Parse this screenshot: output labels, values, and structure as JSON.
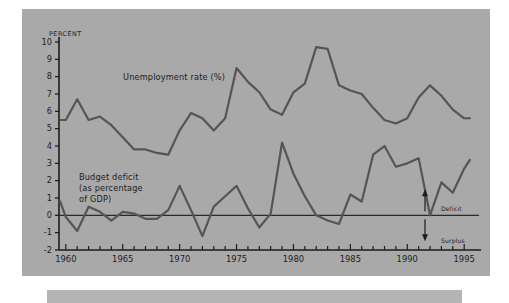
{
  "figure": {
    "axis_unit_label": "PERCENT",
    "background_color": "#a9a9a9",
    "line_color": "#555555",
    "axis_color": "#1d1d1d"
  },
  "annotations": {
    "unemployment_label": "Unemployment rate (%)",
    "budget_label_line1": "Budget deficit",
    "budget_label_line2": "(as percentage",
    "budget_label_line3": "of GDP)",
    "deficit_arrow_label": "Deficit",
    "surplus_arrow_label": "Surplus"
  },
  "chart_data": {
    "type": "line",
    "title": "",
    "xlabel": "",
    "ylabel": "PERCENT",
    "xlim": [
      1959.4,
      1995.6
    ],
    "ylim": [
      -2,
      10
    ],
    "yticks": [
      10,
      9,
      8,
      7,
      6,
      5,
      4,
      3,
      2,
      1,
      0,
      -1,
      -2
    ],
    "ytick_labels": [
      "10",
      "9",
      "8",
      "7",
      "6",
      "5",
      "4",
      "3",
      "2",
      "1",
      "0",
      "-1",
      "-2"
    ],
    "xticks_major": [
      1960,
      1965,
      1970,
      1975,
      1980,
      1985,
      1990,
      1995
    ],
    "xtick_labels": [
      "1960",
      "1965",
      "1970",
      "1975",
      "1980",
      "1985",
      "1990",
      "1995"
    ],
    "xticks_minor_step": 1,
    "grid": false,
    "legend": "inline-annotations",
    "zero_line": true,
    "x": [
      1959.5,
      1960,
      1961,
      1962,
      1963,
      1964,
      1965,
      1966,
      1967,
      1968,
      1969,
      1970,
      1971,
      1972,
      1973,
      1974,
      1975,
      1976,
      1977,
      1978,
      1979,
      1980,
      1981,
      1982,
      1983,
      1984,
      1985,
      1986,
      1987,
      1988,
      1989,
      1990,
      1991,
      1992,
      1993,
      1994,
      1995,
      1995.5
    ],
    "series": [
      {
        "name": "Unemployment rate (%)",
        "color": "#555555",
        "values": [
          5.5,
          5.5,
          6.7,
          5.5,
          5.7,
          5.2,
          4.5,
          3.8,
          3.8,
          3.6,
          3.5,
          4.9,
          5.9,
          5.6,
          4.9,
          5.6,
          8.5,
          7.7,
          7.1,
          6.1,
          5.8,
          7.1,
          7.6,
          9.7,
          9.6,
          7.5,
          7.2,
          7.0,
          6.2,
          5.5,
          5.3,
          5.6,
          6.8,
          7.5,
          6.9,
          6.1,
          5.6,
          5.6
        ]
      },
      {
        "name": "Budget deficit (as percentage of GDP)",
        "color": "#555555",
        "values": [
          0.8,
          -0.1,
          -0.9,
          0.5,
          0.2,
          -0.3,
          0.2,
          0.1,
          -0.2,
          -0.2,
          0.3,
          1.7,
          0.3,
          -1.2,
          0.5,
          1.1,
          1.7,
          0.4,
          -0.7,
          0.1,
          4.2,
          2.9,
          1.7,
          0.6,
          -0.4,
          -0.5,
          1.2,
          0.8,
          3.5,
          4.0,
          2.8,
          3.0,
          3.3,
          0.0,
          1.9,
          1.3,
          2.7,
          3.2
        ]
      }
    ],
    "series_note": "Deficit series continues: 1992 peak 4.1, 1993 3.0, 1994 1.8, 1995 2.1"
  },
  "deficit_points": {
    "years": [
      1959.5,
      1960,
      1961,
      1962,
      1963,
      1964,
      1965,
      1966,
      1967,
      1968,
      1969,
      1970,
      1971,
      1972,
      1973,
      1974,
      1975,
      1976,
      1977,
      1978,
      1979,
      1980,
      1981,
      1982,
      1983,
      1984,
      1985,
      1986,
      1987,
      1988,
      1989,
      1990,
      1991,
      1992,
      1993,
      1994,
      1995,
      1995.5
    ],
    "values": [
      0.8,
      -0.1,
      -0.9,
      0.5,
      0.2,
      -0.3,
      0.2,
      0.1,
      -0.2,
      -0.2,
      0.3,
      1.7,
      0.3,
      -1.2,
      0.5,
      1.1,
      1.7,
      0.4,
      -0.7,
      0.1,
      4.2,
      2.4,
      1.1,
      0.0,
      -0.3,
      -0.5,
      1.2,
      0.8,
      3.5,
      4.0,
      2.8,
      3.0,
      3.3,
      0.0,
      1.9,
      1.3,
      2.7,
      3.2
    ]
  }
}
